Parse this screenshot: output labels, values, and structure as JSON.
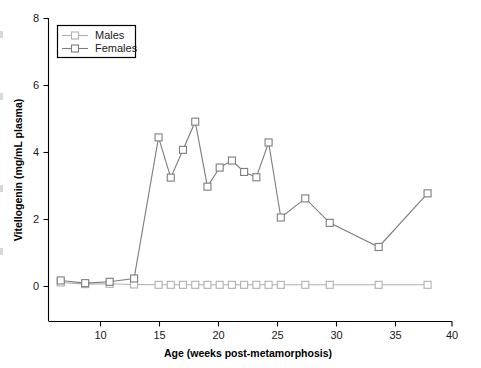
{
  "chart_data": {
    "type": "line",
    "title": "",
    "xlabel": "Age (weeks post-metamorphosis)",
    "ylabel": "Vitellogenin (mg/mL plasma)",
    "xlim": [
      7,
      40
    ],
    "ylim": [
      0,
      8
    ],
    "xticks": [
      10,
      15,
      20,
      25,
      30,
      35,
      40
    ],
    "yticks": [
      0,
      2,
      4,
      6,
      8
    ],
    "grid": false,
    "legend_position": "top-left",
    "series": [
      {
        "name": "Males",
        "color": "#b0b0b0",
        "marker": "open-square",
        "x": [
          8,
          10,
          12,
          14,
          16,
          17,
          18,
          19,
          20,
          21,
          22,
          23,
          24,
          25,
          26,
          28,
          30,
          34,
          38
        ],
        "values": [
          0.12,
          0.07,
          0.08,
          0.06,
          0.05,
          0.05,
          0.05,
          0.05,
          0.05,
          0.05,
          0.05,
          0.05,
          0.05,
          0.05,
          0.05,
          0.05,
          0.05,
          0.05,
          0.05
        ]
      },
      {
        "name": "Females",
        "color": "#7d7d7d",
        "marker": "open-square",
        "x": [
          8,
          10,
          12,
          14,
          16,
          17,
          18,
          19,
          20,
          21,
          22,
          23,
          24,
          25,
          26,
          28,
          30,
          34,
          38
        ],
        "values": [
          0.18,
          0.1,
          0.14,
          0.24,
          4.45,
          3.25,
          4.08,
          4.92,
          2.98,
          3.55,
          3.76,
          3.42,
          3.26,
          4.3,
          2.06,
          2.63,
          1.9,
          1.18,
          2.78
        ]
      }
    ]
  },
  "legend": {
    "entries": [
      {
        "label": "Males"
      },
      {
        "label": "Females"
      }
    ]
  },
  "axes": {
    "y_tick_labels": [
      "8",
      "6",
      "4",
      "2",
      "0"
    ],
    "x_tick_labels": [
      "10",
      "15",
      "20",
      "25",
      "30",
      "35",
      "40"
    ],
    "y_title": "Vitellogenin (mg/mL plasma)",
    "x_title": "Age (weeks post-metamorphosis)"
  }
}
